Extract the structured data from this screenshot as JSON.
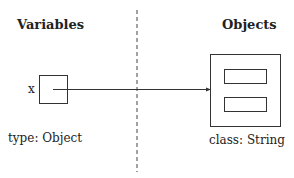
{
  "diagram": {
    "left_heading": "Variables",
    "right_heading": "Objects",
    "variable": {
      "name": "x",
      "type_label": "type: Object"
    },
    "object": {
      "class_label": "class: String",
      "field_count": 2
    },
    "colors": {
      "stroke": "#333333",
      "text": "#222222",
      "background": "#ffffff"
    }
  }
}
